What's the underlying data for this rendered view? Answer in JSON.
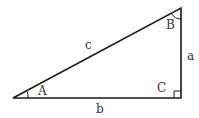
{
  "diagram": {
    "type": "right-triangle",
    "stroke_color": "#1a1a1a",
    "label_color": "#333333",
    "vertices": {
      "A": {
        "label": "A"
      },
      "B": {
        "label": "B"
      },
      "C": {
        "label": "C"
      }
    },
    "sides": {
      "a": {
        "label": "a"
      },
      "b": {
        "label": "b"
      },
      "c": {
        "label": "c"
      }
    }
  }
}
